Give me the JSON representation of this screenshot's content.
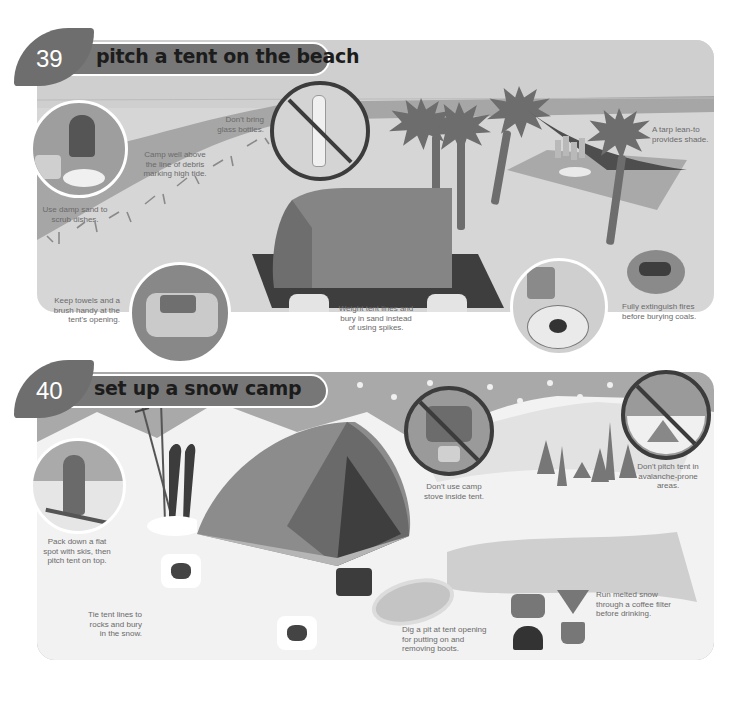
{
  "sections": [
    {
      "number": "39",
      "title": "pitch a tent on the beach",
      "tips": {
        "glass": "Don't bring glass bottles.",
        "dishes": "Use damp sand to scrub dishes.",
        "tide": "Camp well above the line of debris marking high tide.",
        "towels": "Keep towels and a brush handy at the tent's opening.",
        "lines": "Weight tent lines and bury in sand instead of using spikes.",
        "tarp": "A tarp lean-to provides shade.",
        "fires": "Fully extinguish fires before burying coals."
      },
      "illustrations": [
        "no-glass-bottle-icon",
        "washing-dishes-circle",
        "towels-brush-circle",
        "a-frame-tent",
        "sand-bag-anchors",
        "palm-trees",
        "tarp-lean-to",
        "campfire-pit",
        "extinguish-fire-circle"
      ]
    },
    {
      "number": "40",
      "title": "set up a snow camp",
      "tips": {
        "pack": "Pack down a flat spot with skis, then pitch tent on top.",
        "stove": "Don't use camp stove inside tent.",
        "avalanche": "Don't pitch tent in avalanche-prone areas.",
        "rocks": "Tie tent lines to rocks and bury in the snow.",
        "pit": "Dig a pit at tent opening for putting on and removing boots.",
        "melt": "Run melted snow through a coffee filter before drinking."
      },
      "illustrations": [
        "skier-circle",
        "ski-poles-skis",
        "dome-tent",
        "rock-anchors",
        "boots",
        "boot-pit",
        "no-stove-in-tent-icon",
        "no-avalanche-icon",
        "pine-trees",
        "stove-pot-filter"
      ]
    }
  ],
  "colors": {
    "header_leaf": "#6e6e6e",
    "header_bar": "#777777",
    "beach_bg": "#d6d6d6",
    "snow_sky": "#a9a9a9",
    "snow_ground": "#f2f2f2",
    "tent": "#7f7f7f",
    "ban_ring": "#3c3c3c"
  }
}
